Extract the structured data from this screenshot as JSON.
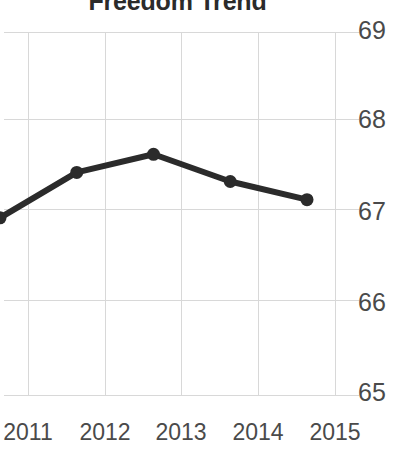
{
  "chart_data": {
    "type": "line",
    "title": "Freedom Trend",
    "xlabel": "",
    "ylabel": "",
    "categories": [
      "2011",
      "2012",
      "2013",
      "2014",
      "2015"
    ],
    "x": [
      2011,
      2012,
      2013,
      2014,
      2015
    ],
    "values": [
      66.6,
      67.1,
      67.3,
      67.0,
      66.8
    ],
    "series": [
      {
        "name": "Freedom",
        "values": [
          66.6,
          67.1,
          67.3,
          67.0,
          66.8
        ]
      }
    ],
    "ylim": [
      65,
      69
    ],
    "yticks": [
      65,
      66,
      67,
      68,
      69
    ],
    "ytick_labels": [
      "65",
      "66",
      "67",
      "68",
      "69"
    ],
    "xticks": [
      2011,
      2012,
      2013,
      2014,
      2015
    ],
    "xtick_labels": [
      "2011",
      "2012",
      "2013",
      "2014",
      "2015"
    ],
    "grid": true,
    "legend": false,
    "legend_position": "none",
    "y_axis_side": "right",
    "markers": true,
    "line_color": "#2b2b2b",
    "marker_color": "#2b2b2b",
    "grid_color": "#d8d8d8",
    "text_color": "#4a4a4a",
    "title_color": "#2b2b2b",
    "background_color": "#ffffff"
  }
}
